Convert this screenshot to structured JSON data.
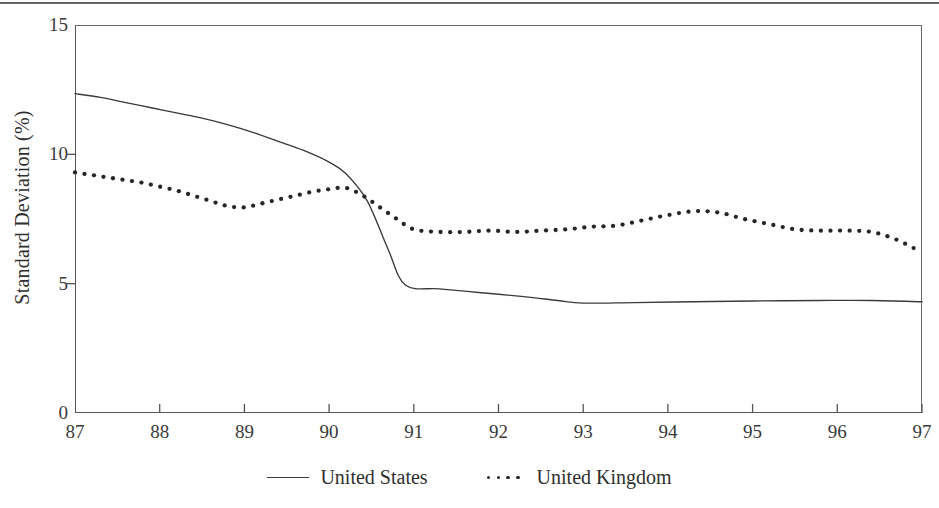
{
  "figure": {
    "rule_name": "page-separator-rule"
  },
  "chart_data": {
    "type": "line",
    "title": "",
    "xlabel": "",
    "ylabel": "Standard Deviation (%)",
    "xlim": [
      87,
      97
    ],
    "ylim": [
      0,
      15
    ],
    "yticks": [
      0,
      5,
      10,
      15
    ],
    "xticks": [
      87,
      88,
      89,
      90,
      91,
      92,
      93,
      94,
      95,
      96,
      97
    ],
    "xtick_labels": [
      "87",
      "88",
      "89",
      "90",
      "91",
      "92",
      "93",
      "94",
      "95",
      "96",
      "97"
    ],
    "ytick_labels": [
      "0",
      "5",
      "10",
      "15"
    ],
    "grid": false,
    "legend_position": "below-axis-center",
    "series": [
      {
        "name": "United States",
        "style": "solid",
        "color": "#3b3b3b",
        "x": [
          87.0,
          87.3,
          87.6,
          87.9,
          88.2,
          88.5,
          88.8,
          89.1,
          89.4,
          89.7,
          90.0,
          90.2,
          90.45,
          90.7,
          90.9,
          91.3,
          91.8,
          92.3,
          92.7,
          93.0,
          93.6,
          94.3,
          95.0,
          95.8,
          96.4,
          97.0
        ],
        "y": [
          12.35,
          12.2,
          12.0,
          11.8,
          11.6,
          11.4,
          11.15,
          10.85,
          10.5,
          10.15,
          9.7,
          9.25,
          8.2,
          6.3,
          4.95,
          4.8,
          4.65,
          4.5,
          4.35,
          4.25,
          4.27,
          4.3,
          4.33,
          4.35,
          4.35,
          4.3
        ]
      },
      {
        "name": "United Kingdom",
        "style": "dotted",
        "color": "#262626",
        "x": [
          87.0,
          87.2,
          87.4,
          87.6,
          87.8,
          88.0,
          88.2,
          88.4,
          88.6,
          88.8,
          89.0,
          89.2,
          89.4,
          89.6,
          89.8,
          90.0,
          90.2,
          90.4,
          90.6,
          90.8,
          91.0,
          91.3,
          91.6,
          91.9,
          92.2,
          92.5,
          92.8,
          93.1,
          93.4,
          93.7,
          94.0,
          94.3,
          94.6,
          94.9,
          95.2,
          95.5,
          95.8,
          96.1,
          96.4,
          96.7,
          97.0
        ],
        "y": [
          9.3,
          9.2,
          9.1,
          9.0,
          8.9,
          8.75,
          8.6,
          8.4,
          8.2,
          8.0,
          7.95,
          8.1,
          8.25,
          8.4,
          8.55,
          8.65,
          8.7,
          8.4,
          7.95,
          7.5,
          7.1,
          7.0,
          7.0,
          7.05,
          7.0,
          7.05,
          7.1,
          7.2,
          7.25,
          7.45,
          7.65,
          7.8,
          7.75,
          7.5,
          7.3,
          7.1,
          7.05,
          7.05,
          7.0,
          6.7,
          6.2
        ]
      }
    ]
  },
  "legend": {
    "entries": [
      {
        "label": "United States",
        "style": "solid"
      },
      {
        "label": "United Kingdom",
        "style": "dotted"
      }
    ]
  }
}
